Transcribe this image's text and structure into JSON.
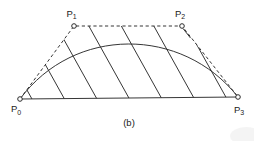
{
  "figure": {
    "caption": "(b)",
    "colors": {
      "stroke": "#2b2b2b",
      "background": "#ffffff",
      "artifact": "#ececec"
    },
    "canvas": {
      "width": 254,
      "height": 141
    },
    "points": [
      {
        "id": "p0",
        "base": "P",
        "sub": "0",
        "x": 20,
        "y": 99,
        "label_x": 11,
        "label_y": 112
      },
      {
        "id": "p1",
        "base": "P",
        "sub": "1",
        "x": 74,
        "y": 26,
        "label_x": 66.5,
        "label_y": 16.5
      },
      {
        "id": "p2",
        "base": "P",
        "sub": "2",
        "x": 182,
        "y": 26,
        "label_x": 175,
        "label_y": 16.5
      },
      {
        "id": "p3",
        "base": "P",
        "sub": "3",
        "x": 238,
        "y": 97,
        "label_x": 234,
        "label_y": 112.5
      }
    ],
    "marker_radius": 2.3,
    "paths": {
      "control_polygon": "M20,99 L74,26 L182,26 L238,97",
      "baseline": "M20,99 L238,97",
      "curve": "M20,99 C74,26 182,26 238,97",
      "hatch": "M-12,20 L34.2,103 M20.5,20 L66.7,103 M53,20 L99.2,103 M85.5,20 L131.7,103 M118,20 L164.2,103 M150.5,20 L196.7,103 M183,20 L229.2,103",
      "edge_stroke": "M183,28.5 L190.5,38",
      "clip_points": "20,99 74,26 182,26 238,97",
      "dash_array": "3.2,2.6"
    }
  }
}
